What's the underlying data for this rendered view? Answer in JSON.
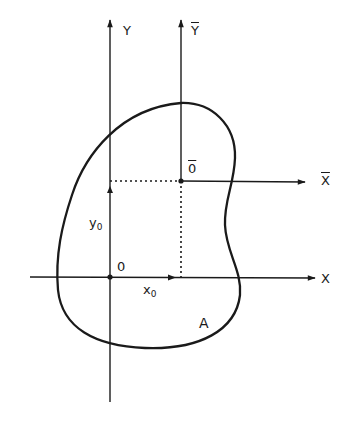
{
  "diagram": {
    "type": "centroid coordinate diagram",
    "colors": {
      "stroke": "#1a1a1a",
      "background": "#ffffff"
    },
    "axes": {
      "y": {
        "label": "Y"
      },
      "y_bar": {
        "label": "Y",
        "overline": true
      },
      "x": {
        "label": "X"
      },
      "x_bar": {
        "label": "X",
        "overline": true
      }
    },
    "points": {
      "origin": {
        "label": "0"
      },
      "centroid": {
        "label": "0",
        "overline": true
      }
    },
    "offsets": {
      "x0": {
        "base": "x",
        "sub": "0"
      },
      "y0": {
        "base": "y",
        "sub": "0"
      }
    },
    "region": {
      "label": "A"
    }
  }
}
